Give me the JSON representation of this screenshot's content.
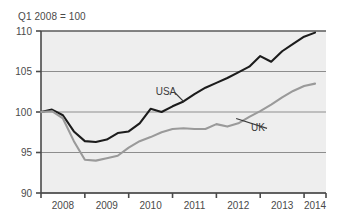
{
  "chart_data": {
    "type": "line",
    "title": "Q1 2008 = 100",
    "xlabel": "",
    "ylabel": "",
    "ylim": [
      90,
      110
    ],
    "yticks": [
      90,
      95,
      100,
      105,
      110
    ],
    "xlim": [
      2008.0,
      2014.5
    ],
    "xticks": [
      2008,
      2009,
      2010,
      2011,
      2012,
      2013,
      2014
    ],
    "xtick_labels": [
      "2008",
      "2009",
      "2010",
      "2011",
      "2012",
      "2013",
      "2014"
    ],
    "grid": true,
    "legend_position": "inline-annotation",
    "annotations": [
      {
        "text": "USA",
        "x": 2010.85,
        "y": 102.5,
        "points_to_x": 2011.25,
        "points_to_y": 101.3
      },
      {
        "text": "UK",
        "x": 2012.95,
        "y": 98.1,
        "points_to_x": 2012.45,
        "points_to_y": 99.2
      }
    ],
    "series": [
      {
        "name": "USA",
        "color": "#1c1c1c",
        "x": [
          2008.0,
          2008.25,
          2008.5,
          2008.75,
          2009.0,
          2009.25,
          2009.5,
          2009.75,
          2010.0,
          2010.25,
          2010.5,
          2010.75,
          2011.0,
          2011.25,
          2011.5,
          2011.75,
          2012.0,
          2012.25,
          2012.5,
          2012.75,
          2013.0,
          2013.25,
          2013.5,
          2013.75,
          2014.0,
          2014.25
        ],
        "values": [
          100.0,
          100.3,
          99.6,
          97.6,
          96.4,
          96.3,
          96.6,
          97.4,
          97.6,
          98.6,
          100.4,
          100.0,
          100.7,
          101.3,
          102.2,
          103.0,
          103.6,
          104.2,
          104.9,
          105.6,
          106.9,
          106.2,
          107.5,
          108.4,
          109.3,
          109.8
        ]
      },
      {
        "name": "UK",
        "color": "#9a9a9a",
        "x": [
          2008.0,
          2008.25,
          2008.5,
          2008.75,
          2009.0,
          2009.25,
          2009.5,
          2009.75,
          2010.0,
          2010.25,
          2010.5,
          2010.75,
          2011.0,
          2011.25,
          2011.5,
          2011.75,
          2012.0,
          2012.25,
          2012.5,
          2012.75,
          2013.0,
          2013.25,
          2013.5,
          2013.75,
          2014.0,
          2014.25
        ],
        "values": [
          100.0,
          100.1,
          99.2,
          96.4,
          94.1,
          94.0,
          94.3,
          94.6,
          95.6,
          96.4,
          96.9,
          97.5,
          97.9,
          98.0,
          97.9,
          97.9,
          98.5,
          98.2,
          98.6,
          99.4,
          100.1,
          100.9,
          101.8,
          102.6,
          103.2,
          103.5
        ]
      }
    ]
  }
}
